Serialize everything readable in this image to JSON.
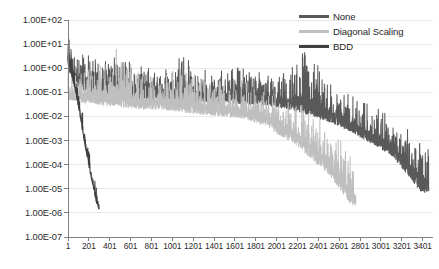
{
  "chart_data": {
    "type": "line",
    "title": "",
    "xlabel": "",
    "ylabel": "",
    "scale_y": "log",
    "grid": true,
    "legend_position": "top-right",
    "xlim": [
      1,
      3500
    ],
    "ylim": [
      1e-07,
      100
    ],
    "x_tick_labels": [
      "1",
      "201",
      "401",
      "601",
      "801",
      "1001",
      "1201",
      "1401",
      "1601",
      "1801",
      "2001",
      "2201",
      "2401",
      "2601",
      "2801",
      "3001",
      "3201",
      "3401"
    ],
    "x_tick_values": [
      1,
      201,
      401,
      601,
      801,
      1001,
      1201,
      1401,
      1601,
      1801,
      2001,
      2201,
      2401,
      2601,
      2801,
      3001,
      3201,
      3401
    ],
    "y_tick_labels": [
      "1.00E+02",
      "1.00E+01",
      "1.00E+00",
      "1.00E-01",
      "1.00E-02",
      "1.00E-03",
      "1.00E-04",
      "1.00E-05",
      "1.00E-06",
      "1.00E-07"
    ],
    "y_tick_values": [
      100,
      10,
      1,
      0.1,
      0.01,
      0.001,
      0.0001,
      1e-05,
      1e-06,
      1e-07
    ],
    "series": [
      {
        "name": "None",
        "color": "#595959",
        "x_start": 1,
        "x_end": 3460,
        "envelope": [
          {
            "x": 1,
            "lo": 1.0,
            "hi": 30.0
          },
          {
            "x": 60,
            "lo": 0.25,
            "hi": 9.0
          },
          {
            "x": 150,
            "lo": 0.12,
            "hi": 4.0
          },
          {
            "x": 300,
            "lo": 0.08,
            "hi": 2.5
          },
          {
            "x": 500,
            "lo": 0.06,
            "hi": 6.0
          },
          {
            "x": 700,
            "lo": 0.05,
            "hi": 1.6
          },
          {
            "x": 900,
            "lo": 0.05,
            "hi": 1.0
          },
          {
            "x": 1100,
            "lo": 0.04,
            "hi": 3.5
          },
          {
            "x": 1300,
            "lo": 0.04,
            "hi": 0.9
          },
          {
            "x": 1500,
            "lo": 0.035,
            "hi": 0.8
          },
          {
            "x": 1700,
            "lo": 0.03,
            "hi": 1.2
          },
          {
            "x": 1900,
            "lo": 0.03,
            "hi": 0.7
          },
          {
            "x": 2100,
            "lo": 0.02,
            "hi": 0.6
          },
          {
            "x": 2300,
            "lo": 0.012,
            "hi": 9.0
          },
          {
            "x": 2500,
            "lo": 0.006,
            "hi": 0.25
          },
          {
            "x": 2700,
            "lo": 0.0025,
            "hi": 0.08
          },
          {
            "x": 2900,
            "lo": 0.0008,
            "hi": 0.03
          },
          {
            "x": 3100,
            "lo": 0.00025,
            "hi": 0.012
          },
          {
            "x": 3250,
            "lo": 4e-05,
            "hi": 0.004
          },
          {
            "x": 3380,
            "lo": 8e-06,
            "hi": 0.0012
          },
          {
            "x": 3460,
            "lo": 6e-06,
            "hi": 0.0004
          }
        ]
      },
      {
        "name": "Diagonal Scaling",
        "color": "#bfbfbf",
        "x_start": 1,
        "x_end": 2760,
        "envelope": [
          {
            "x": 1,
            "lo": 0.05,
            "hi": 0.9
          },
          {
            "x": 100,
            "lo": 0.04,
            "hi": 0.5
          },
          {
            "x": 300,
            "lo": 0.03,
            "hi": 1.8
          },
          {
            "x": 500,
            "lo": 0.025,
            "hi": 12.0
          },
          {
            "x": 700,
            "lo": 0.02,
            "hi": 0.6
          },
          {
            "x": 900,
            "lo": 0.02,
            "hi": 0.5
          },
          {
            "x": 1100,
            "lo": 0.015,
            "hi": 1.2
          },
          {
            "x": 1300,
            "lo": 0.012,
            "hi": 0.4
          },
          {
            "x": 1500,
            "lo": 0.01,
            "hi": 0.35
          },
          {
            "x": 1700,
            "lo": 0.008,
            "hi": 0.3
          },
          {
            "x": 1900,
            "lo": 0.004,
            "hi": 0.2
          },
          {
            "x": 2050,
            "lo": 0.0015,
            "hi": 0.09
          },
          {
            "x": 2200,
            "lo": 0.0006,
            "hi": 0.04
          },
          {
            "x": 2350,
            "lo": 0.00015,
            "hi": 0.015
          },
          {
            "x": 2500,
            "lo": 4e-05,
            "hi": 0.005
          },
          {
            "x": 2620,
            "lo": 8e-06,
            "hi": 0.0012
          },
          {
            "x": 2700,
            "lo": 2.5e-06,
            "hi": 0.0003
          },
          {
            "x": 2760,
            "lo": 1.8e-06,
            "hi": 6e-05
          }
        ]
      },
      {
        "name": "BDD",
        "color": "#404040",
        "x_start": 1,
        "x_end": 300,
        "envelope": [
          {
            "x": 1,
            "lo": 1.5,
            "hi": 12.0
          },
          {
            "x": 20,
            "lo": 0.8,
            "hi": 6.0
          },
          {
            "x": 45,
            "lo": 0.3,
            "hi": 2.5
          },
          {
            "x": 70,
            "lo": 0.12,
            "hi": 0.8
          },
          {
            "x": 95,
            "lo": 0.03,
            "hi": 0.2
          },
          {
            "x": 120,
            "lo": 0.008,
            "hi": 0.05
          },
          {
            "x": 150,
            "lo": 0.0012,
            "hi": 0.008
          },
          {
            "x": 180,
            "lo": 0.00025,
            "hi": 0.0015
          },
          {
            "x": 210,
            "lo": 5e-05,
            "hi": 0.0003
          },
          {
            "x": 240,
            "lo": 1.2e-05,
            "hi": 7e-05
          },
          {
            "x": 265,
            "lo": 3.5e-06,
            "hi": 1.8e-05
          },
          {
            "x": 285,
            "lo": 1.8e-06,
            "hi": 5e-06
          },
          {
            "x": 300,
            "lo": 1.3e-06,
            "hi": 2.5e-06
          }
        ]
      }
    ]
  },
  "legend": {
    "items": [
      {
        "label": "None",
        "color": "#595959"
      },
      {
        "label": "Diagonal Scaling",
        "color": "#bfbfbf"
      },
      {
        "label": "BDD",
        "color": "#404040"
      }
    ]
  },
  "axes": {
    "gridline_color": "#e8e8e8",
    "axis_color": "#808080",
    "tick_color": "#808080"
  }
}
